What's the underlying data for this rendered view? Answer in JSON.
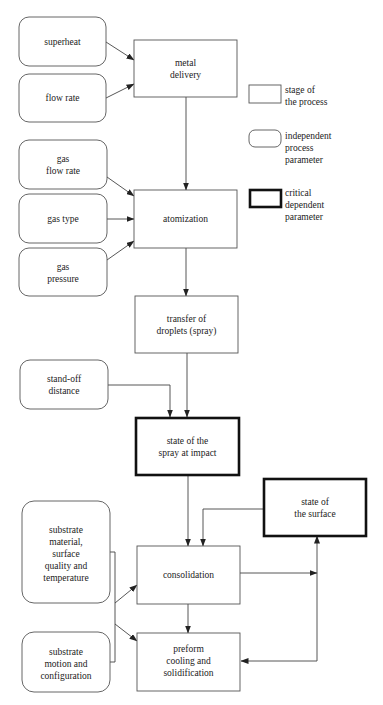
{
  "diagram": {
    "type": "process-flowchart",
    "nodes": {
      "superheat": {
        "lines": [
          "superheat"
        ],
        "kind": "independent"
      },
      "flow_rate": {
        "lines": [
          "flow rate"
        ],
        "kind": "independent"
      },
      "metal_delivery": {
        "lines": [
          "metal",
          "delivery"
        ],
        "kind": "stage"
      },
      "gas_flow_rate": {
        "lines": [
          "gas",
          "flow rate"
        ],
        "kind": "independent"
      },
      "gas_type": {
        "lines": [
          "gas type"
        ],
        "kind": "independent"
      },
      "gas_pressure": {
        "lines": [
          "gas",
          "pressure"
        ],
        "kind": "independent"
      },
      "atomization": {
        "lines": [
          "atomization"
        ],
        "kind": "stage"
      },
      "transfer": {
        "lines": [
          "transfer of",
          "droplets (spray)"
        ],
        "kind": "stage"
      },
      "standoff": {
        "lines": [
          "stand-off",
          "distance"
        ],
        "kind": "independent"
      },
      "spray_impact": {
        "lines": [
          "state of the",
          "spray at impact"
        ],
        "kind": "critical"
      },
      "surface_state": {
        "lines": [
          "state of",
          "the surface"
        ],
        "kind": "critical"
      },
      "substrate_material": {
        "lines": [
          "substrate",
          "material,",
          "surface",
          "quality and",
          "temperature"
        ],
        "kind": "independent"
      },
      "consolidation": {
        "lines": [
          "consolidation"
        ],
        "kind": "stage"
      },
      "substrate_motion": {
        "lines": [
          "substrate",
          "motion and",
          "configuration"
        ],
        "kind": "independent"
      },
      "preform": {
        "lines": [
          "preform",
          "cooling and",
          "solidification"
        ],
        "kind": "stage"
      }
    },
    "edges": [
      [
        "superheat",
        "metal_delivery"
      ],
      [
        "flow_rate",
        "metal_delivery"
      ],
      [
        "metal_delivery",
        "atomization"
      ],
      [
        "gas_flow_rate",
        "atomization"
      ],
      [
        "gas_type",
        "atomization"
      ],
      [
        "gas_pressure",
        "atomization"
      ],
      [
        "atomization",
        "transfer"
      ],
      [
        "transfer",
        "spray_impact"
      ],
      [
        "standoff",
        "spray_impact"
      ],
      [
        "spray_impact",
        "consolidation"
      ],
      [
        "surface_state",
        "consolidation"
      ],
      [
        "substrate_material",
        "consolidation"
      ],
      [
        "substrate_material",
        "preform"
      ],
      [
        "substrate_motion",
        "consolidation"
      ],
      [
        "substrate_motion",
        "preform"
      ],
      [
        "consolidation",
        "preform"
      ],
      [
        "consolidation",
        "surface_state"
      ],
      [
        "preform",
        "surface_state"
      ],
      [
        "surface_state",
        "preform"
      ]
    ]
  },
  "legend": {
    "stage": {
      "lines": [
        "stage of",
        "the process"
      ]
    },
    "independent": {
      "lines": [
        "independent",
        "process",
        "parameter"
      ]
    },
    "critical": {
      "lines": [
        "critical",
        "dependent",
        "parameter"
      ]
    }
  }
}
